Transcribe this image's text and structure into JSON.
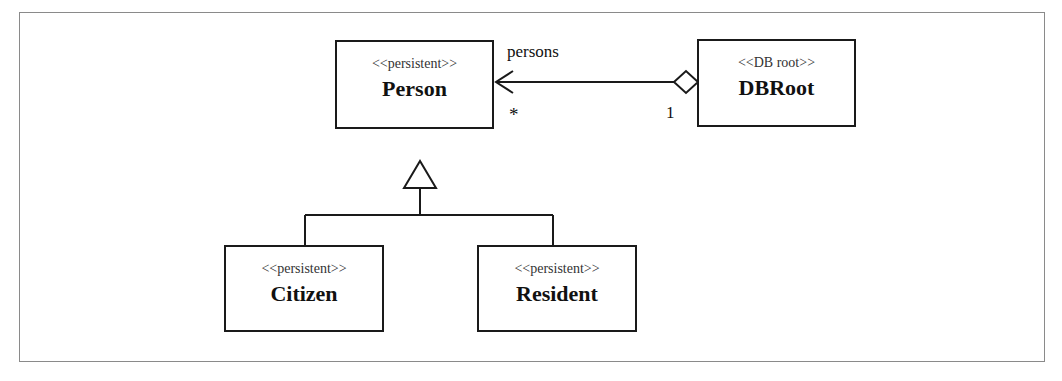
{
  "diagram": {
    "type": "UML class diagram",
    "classes": [
      {
        "id": "person",
        "stereotype": "<<persistent>>",
        "name": "Person"
      },
      {
        "id": "dbroot",
        "stereotype": "<<DB root>>",
        "name": "DBRoot"
      },
      {
        "id": "citizen",
        "stereotype": "<<persistent>>",
        "name": "Citizen"
      },
      {
        "id": "resident",
        "stereotype": "<<persistent>>",
        "name": "Resident"
      }
    ],
    "association": {
      "from": "DBRoot",
      "to": "Person",
      "kind": "aggregation",
      "role": "persons",
      "multiplicity_target": "*",
      "multiplicity_source": "1"
    },
    "generalizations": [
      {
        "child": "Citizen",
        "parent": "Person"
      },
      {
        "child": "Resident",
        "parent": "Person"
      }
    ],
    "colors": {
      "line": "#1a1a1a",
      "frame": "#8a8a8a",
      "background": "#ffffff"
    }
  }
}
